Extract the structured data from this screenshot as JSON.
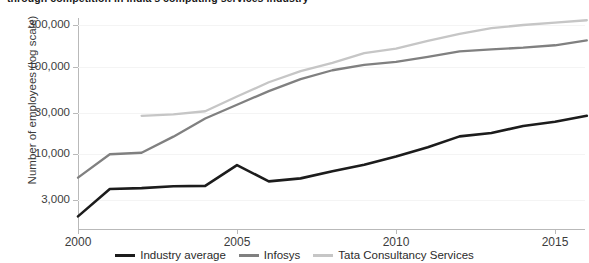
{
  "chart_data": {
    "type": "line",
    "title": "through competition in India's computing services industry",
    "xlabel": "",
    "ylabel": "Number of employees (log scale)",
    "yscale": "log",
    "ylim": [
      1800,
      380000
    ],
    "xlim": [
      2000,
      2016
    ],
    "ytick_labels": [
      "300,000",
      "100,000",
      "30,000",
      "10,000",
      "3,000"
    ],
    "ytick_values": [
      300000,
      100000,
      30000,
      10000,
      3000
    ],
    "xtick_labels": [
      "2000",
      "2005",
      "2010",
      "2015"
    ],
    "xtick_values": [
      2000,
      2005,
      2010,
      2015
    ],
    "grid": true,
    "legend_position": "bottom",
    "series": [
      {
        "name": "Industry average",
        "color": "#1c1c1c",
        "x": [
          2000,
          2001,
          2002,
          2003,
          2004,
          2005,
          2006,
          2007,
          2008,
          2009,
          2010,
          2011,
          2012,
          2013,
          2014,
          2015,
          2016
        ],
        "values": [
          1950,
          4000,
          4100,
          4300,
          4350,
          7500,
          4900,
          5300,
          6400,
          7600,
          9400,
          12000,
          16000,
          17500,
          21000,
          23500,
          27500
        ]
      },
      {
        "name": "Infosys",
        "color": "#808080",
        "x": [
          2000,
          2001,
          2002,
          2003,
          2004,
          2005,
          2006,
          2007,
          2008,
          2009,
          2010,
          2011,
          2012,
          2013,
          2014,
          2015,
          2016
        ],
        "values": [
          5400,
          10000,
          10400,
          15900,
          25600,
          36800,
          52700,
          72200,
          91200,
          105000,
          113800,
          130000,
          150000,
          158000,
          165000,
          176000,
          200000
        ]
      },
      {
        "name": "Tata Consultancy Services",
        "color": "#c6c6c6",
        "x": [
          2002,
          2003,
          2004,
          2005,
          2006,
          2007,
          2008,
          2009,
          2010,
          2011,
          2012,
          2013,
          2014,
          2015,
          2016
        ],
        "values": [
          27500,
          28500,
          31000,
          45700,
          66500,
          89000,
          111000,
          143000,
          161000,
          198000,
          238000,
          276000,
          300000,
          319000,
          340000
        ]
      }
    ]
  },
  "legend": [
    {
      "label": "Industry average",
      "color": "#1c1c1c"
    },
    {
      "label": "Infosys",
      "color": "#808080"
    },
    {
      "label": "Tata Consultancy Services",
      "color": "#c6c6c6"
    }
  ]
}
